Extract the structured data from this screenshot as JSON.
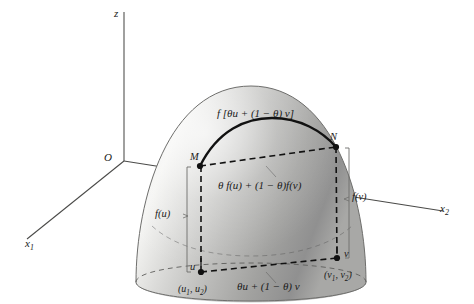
{
  "figure": {
    "background": "#ffffff",
    "surface": {
      "name": "paraboloid-dome",
      "fill_light": "#f2f2f0",
      "fill_mid": "#c9c9c7",
      "fill_dark": "#8e8e8c",
      "outline": "#6a6a68"
    },
    "axes": {
      "z_label": "z",
      "x1_label": "x",
      "x1_sub": "1",
      "x2_label": "x",
      "x2_sub": "2",
      "origin_label": "O",
      "color": "#4a4a48"
    },
    "points": {
      "M": "M",
      "N": "N",
      "u": "u",
      "v": "v",
      "u_coords_open": "(u",
      "u_coords_sub1": "1",
      "u_coords_mid": ", u",
      "u_coords_sub2": "2",
      "u_coords_close": ")",
      "v_coords_open": "(v",
      "v_coords_sub1": "1",
      "v_coords_mid": ", v",
      "v_coords_sub2": "2",
      "v_coords_close": ")"
    },
    "labels": {
      "top_curve": "f [θu + (1 − θ) v]",
      "chord": "θ f(u) + (1 − θ)f(v)",
      "base_chord": "θu + (1 − θ) v",
      "f_of_u": "f(u)",
      "f_of_v": "f(v)"
    },
    "line_styles": {
      "solid_curve": "#111111",
      "dashed": "#111111",
      "thin_guide": "#777775"
    }
  }
}
